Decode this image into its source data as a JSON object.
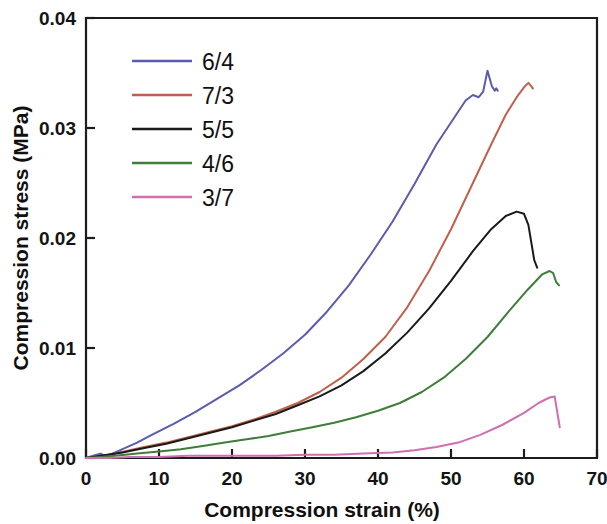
{
  "chart_data": {
    "type": "line",
    "title": "",
    "xlabel": "Compression strain (%)",
    "ylabel": "Compression stress (MPa)",
    "xlim": [
      0,
      70
    ],
    "ylim": [
      0,
      0.04
    ],
    "xticks": [
      0,
      10,
      20,
      30,
      40,
      50,
      60,
      70
    ],
    "xtick_labels": [
      "0",
      "10",
      "20",
      "30",
      "40",
      "50",
      "60",
      "70"
    ],
    "yticks": [
      0,
      0.01,
      0.02,
      0.03,
      0.04
    ],
    "ytick_labels": [
      "0.00",
      "0.01",
      "0.02",
      "0.03",
      "0.04"
    ],
    "grid": false,
    "legend_position": "upper left inside",
    "series": [
      {
        "name": "6/4",
        "color": "#5b5bb0",
        "x": [
          0,
          1.0,
          2.0,
          2.6,
          3.2,
          4.0,
          5.0,
          7.0,
          9.0,
          12.0,
          15.0,
          18.0,
          21.0,
          24.0,
          27.0,
          30.0,
          33.0,
          36.0,
          39.0,
          42.0,
          45.0,
          48.0,
          50.5,
          52.0,
          53.0,
          53.8,
          54.4,
          55.0,
          55.6,
          56.0,
          56.2,
          56.4
        ],
        "y": [
          0.0,
          0.0002,
          0.0004,
          0.0002,
          0.0003,
          0.0005,
          0.0008,
          0.0014,
          0.0021,
          0.0031,
          0.0042,
          0.0054,
          0.0066,
          0.008,
          0.0095,
          0.0112,
          0.0133,
          0.0157,
          0.0185,
          0.0215,
          0.0249,
          0.0285,
          0.031,
          0.0325,
          0.033,
          0.0328,
          0.0333,
          0.0352,
          0.0338,
          0.0334,
          0.0336,
          0.0334
        ]
      },
      {
        "name": "7/3",
        "color": "#c0604a",
        "x": [
          0,
          1.0,
          2.0,
          3.0,
          4.0,
          6.0,
          8.0,
          11.0,
          14.0,
          17.0,
          20.0,
          23.0,
          26.0,
          29.0,
          32.0,
          35.0,
          38.0,
          41.0,
          44.0,
          47.0,
          50.0,
          53.0,
          55.5,
          57.5,
          59.0,
          60.0,
          60.6,
          61.0,
          61.2
        ],
        "y": [
          0.0,
          0.0001,
          0.0002,
          0.0003,
          0.0004,
          0.0007,
          0.001,
          0.0014,
          0.0019,
          0.0024,
          0.0029,
          0.0035,
          0.0042,
          0.005,
          0.006,
          0.0073,
          0.009,
          0.011,
          0.0137,
          0.017,
          0.0208,
          0.025,
          0.0285,
          0.0312,
          0.0328,
          0.0337,
          0.0341,
          0.0338,
          0.0336
        ]
      },
      {
        "name": "5/5",
        "color": "#1a1a1a",
        "x": [
          0,
          1.0,
          2.0,
          3.0,
          5.0,
          8.0,
          11.0,
          14.0,
          17.0,
          20.0,
          23.0,
          26.0,
          29.0,
          32.0,
          35.0,
          38.0,
          41.0,
          44.0,
          47.0,
          50.0,
          53.0,
          55.5,
          57.5,
          59.0,
          60.0,
          60.6,
          61.0,
          61.4,
          61.8
        ],
        "y": [
          0.0,
          0.0001,
          0.0002,
          0.0003,
          0.0005,
          0.0009,
          0.0013,
          0.0018,
          0.0023,
          0.0028,
          0.0034,
          0.004,
          0.0048,
          0.0056,
          0.0066,
          0.0079,
          0.0095,
          0.0114,
          0.0136,
          0.0161,
          0.0188,
          0.0208,
          0.022,
          0.0224,
          0.0222,
          0.0212,
          0.0196,
          0.018,
          0.0173
        ]
      },
      {
        "name": "4/6",
        "color": "#3f7d3a",
        "x": [
          0,
          2.0,
          4.0,
          7.0,
          10.0,
          13.0,
          16.0,
          19.0,
          22.0,
          25.0,
          28.0,
          31.0,
          34.0,
          37.0,
          40.0,
          43.0,
          46.0,
          49.0,
          52.0,
          55.0,
          58.0,
          60.5,
          62.5,
          63.5,
          64.0,
          64.4,
          64.8
        ],
        "y": [
          0.0,
          0.0001,
          0.0002,
          0.0004,
          0.0006,
          0.0008,
          0.0011,
          0.0014,
          0.0017,
          0.002,
          0.0024,
          0.0028,
          0.0032,
          0.0037,
          0.0043,
          0.005,
          0.006,
          0.0073,
          0.009,
          0.011,
          0.0134,
          0.0153,
          0.0167,
          0.017,
          0.0168,
          0.016,
          0.0157
        ]
      },
      {
        "name": "3/7",
        "color": "#cf6fae",
        "x": [
          0,
          3.0,
          6.0,
          10.0,
          14.0,
          18.0,
          22.0,
          26.0,
          30.0,
          34.0,
          38.0,
          42.0,
          45.0,
          48.0,
          51.0,
          54.0,
          57.0,
          60.0,
          62.0,
          63.5,
          64.2,
          64.6,
          64.9
        ],
        "y": [
          0.0,
          0.0,
          0.0001,
          0.0001,
          0.0002,
          0.0002,
          0.0002,
          0.0002,
          0.0003,
          0.0003,
          0.0004,
          0.0005,
          0.0007,
          0.001,
          0.0014,
          0.0021,
          0.003,
          0.0041,
          0.005,
          0.0055,
          0.0056,
          0.004,
          0.0028
        ]
      }
    ]
  },
  "legend": {
    "entries": [
      {
        "label": "6/4",
        "color": "#5b5bb0"
      },
      {
        "label": "7/3",
        "color": "#c0604a"
      },
      {
        "label": "5/5",
        "color": "#1a1a1a"
      },
      {
        "label": "4/6",
        "color": "#3f7d3a"
      },
      {
        "label": "3/7",
        "color": "#cf6fae"
      }
    ]
  },
  "colors": {
    "axis": "#1c1c1c",
    "text": "#101010",
    "background": "#ffffff"
  }
}
